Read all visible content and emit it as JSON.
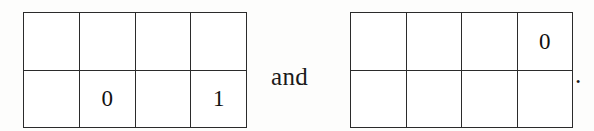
{
  "figure": {
    "kind": "pair-of-grid-tableaux",
    "conjunction": "and",
    "trailing_punctuation": ".",
    "background_color": "#fdfdfc",
    "line_color": "#2b2b2b",
    "text_color": "#1a1a1a"
  },
  "grids": [
    {
      "name": "left-grid",
      "rows": 2,
      "columns": 4,
      "cells": [
        [
          "",
          "",
          "",
          ""
        ],
        [
          "",
          "0",
          "",
          "1"
        ]
      ]
    },
    {
      "name": "right-grid",
      "rows": 2,
      "columns": 4,
      "cells": [
        [
          "",
          "",
          "",
          "0"
        ],
        [
          "",
          "",
          "",
          ""
        ]
      ]
    }
  ]
}
